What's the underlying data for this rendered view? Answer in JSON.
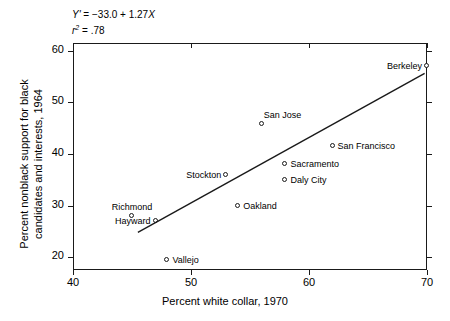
{
  "chart_data": {
    "type": "scatter",
    "title": "",
    "xlabel": "Percent white collar, 1970",
    "ylabel": "Percent nonblack support for black candidates and interests, 1964",
    "ylabel_line1": "Percent nonblack support for black",
    "ylabel_line2": "candidates and interests, 1964",
    "xlim": [
      40,
      70
    ],
    "ylim": [
      17.5,
      61.5
    ],
    "xticks": [
      40,
      50,
      60,
      70
    ],
    "yticks": [
      20,
      30,
      40,
      50,
      60
    ],
    "grid": false,
    "legend": "none",
    "annotations": {
      "equation": "Y' = −33.0 + 1.27X",
      "equation_y": "Y'",
      "equation_rest": " = −33.0 + 1.27",
      "equation_x": "X",
      "r_squared_label": "r",
      "r_squared_exp": "2",
      "r_squared_value": " = .78"
    },
    "fit_line": {
      "type": "linear-regression",
      "intercept": -33.0,
      "slope": 1.27,
      "x_start": 45.5,
      "y_start": 24.8,
      "x_end": 69.8,
      "y_end": 55.6
    },
    "points": [
      {
        "label": "Berkeley",
        "x": 70.0,
        "y": 57.0,
        "label_pos": "left"
      },
      {
        "label": "San Jose",
        "x": 56.0,
        "y": 45.8,
        "label_pos": "aboveright"
      },
      {
        "label": "San Francisco",
        "x": 62.0,
        "y": 41.5,
        "label_pos": "right"
      },
      {
        "label": "Sacramento",
        "x": 58.0,
        "y": 38.0,
        "label_pos": "right"
      },
      {
        "label": "Daly City",
        "x": 58.0,
        "y": 35.0,
        "label_pos": "right"
      },
      {
        "label": "Stockton",
        "x": 53.0,
        "y": 36.0,
        "label_pos": "left"
      },
      {
        "label": "Oakland",
        "x": 54.0,
        "y": 30.0,
        "label_pos": "right"
      },
      {
        "label": "Richmond",
        "x": 45.0,
        "y": 28.0,
        "label_pos": "above"
      },
      {
        "label": "Hayward",
        "x": 47.0,
        "y": 27.0,
        "label_pos": "left"
      },
      {
        "label": "Vallejo",
        "x": 48.0,
        "y": 19.4,
        "label_pos": "right"
      }
    ]
  }
}
